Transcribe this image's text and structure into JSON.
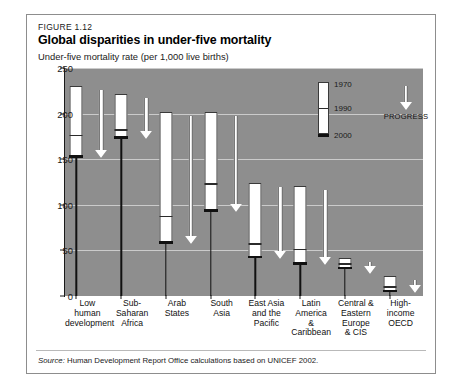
{
  "figure": {
    "number": "FIGURE 1.12",
    "title": "Global disparities in under-five mortality",
    "axis_title": "Under-five mortality rate (per 1,000 live births)",
    "source_word": "Source:",
    "source_text": " Human Development Report Office calculations based on UNICEF 2002."
  },
  "legend": {
    "top_label": "1970",
    "mid_label": "1990",
    "bottom_label": "2000",
    "progress_label": "PROGRESS"
  },
  "colors": {
    "plot_background": "#8e8e8e",
    "bar_fill": "#ffffff",
    "bar_outline": "#3a3a3a",
    "marker_2000": "#111111",
    "gridline": "#d6d6d6",
    "card_border": "#8d8d8d"
  },
  "chart_data": {
    "type": "bar",
    "title": "Global disparities in under-five mortality",
    "subtitle": "FIGURE 1.12",
    "xlabel": "",
    "ylabel": "Under-five mortality rate (per 1,000 live births)",
    "ylim": [
      0,
      250
    ],
    "yticks": [
      0,
      50,
      100,
      150,
      200,
      250
    ],
    "ytick_labels": [
      "0",
      "50",
      "100",
      "150",
      "200",
      "250"
    ],
    "grid": true,
    "legend_position": "inside-top-right",
    "annotation": "PROGRESS",
    "categories": [
      "Low human development",
      "Sub-Saharan Africa",
      "Arab States",
      "South Asia",
      "East Asia and the Pacific",
      "Latin America & Caribbean",
      "Central & Eastern Europe & CIS",
      "High-income OECD"
    ],
    "category_lines": [
      [
        "Low",
        "human",
        "development"
      ],
      [
        "Sub-Saharan",
        "Africa"
      ],
      [
        "Arab",
        "States"
      ],
      [
        "South",
        "Asia"
      ],
      [
        "East Asia",
        "and the",
        "Pacific"
      ],
      [
        "Latin",
        "America",
        "& Caribbean"
      ],
      [
        "Central &",
        "Eastern",
        "Europe",
        "& CIS"
      ],
      [
        "High-",
        "income",
        "OECD"
      ]
    ],
    "series": [
      {
        "name": "1970",
        "values": [
          230,
          222,
          202,
          202,
          124,
          121,
          42,
          22
        ]
      },
      {
        "name": "1990",
        "values": [
          177,
          183,
          88,
          124,
          58,
          52,
          36,
          11
        ]
      },
      {
        "name": "2000",
        "values": [
          153,
          174,
          59,
          94,
          43,
          36,
          31,
          6
        ]
      }
    ]
  }
}
